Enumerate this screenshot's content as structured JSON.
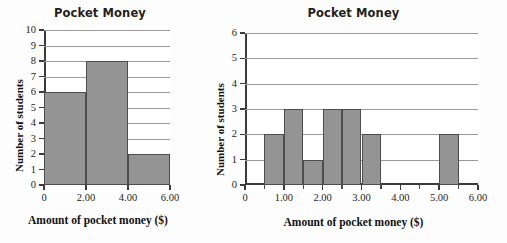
{
  "chart_data": [
    {
      "id": "left",
      "type": "bar",
      "title": "Pocket Money",
      "xlabel": "Amount of pocket money ($)",
      "ylabel": "Number of students",
      "grid": true,
      "xlim": [
        0,
        6
      ],
      "ylim": [
        0,
        10
      ],
      "yticks": [
        0,
        1,
        2,
        3,
        4,
        5,
        6,
        7,
        8,
        9,
        10
      ],
      "ytick_labels": [
        "0",
        "1",
        "2",
        "3",
        "4",
        "5",
        "6",
        "7",
        "8",
        "9",
        "10"
      ],
      "xticks": [
        0,
        2,
        4,
        6
      ],
      "xtick_labels": [
        "0",
        "2.00",
        "4.00",
        "6.00"
      ],
      "bin_width": 2,
      "bins": [
        {
          "start": 0,
          "end": 2,
          "value": 6
        },
        {
          "start": 2,
          "end": 4,
          "value": 8
        },
        {
          "start": 4,
          "end": 6,
          "value": 2
        }
      ]
    },
    {
      "id": "right",
      "type": "bar",
      "title": "Pocket Money",
      "xlabel": "Amount of pocket money ($)",
      "ylabel": "Number of students",
      "grid": true,
      "xlim": [
        0,
        6
      ],
      "ylim": [
        0,
        6
      ],
      "yticks": [
        0,
        1,
        2,
        3,
        4,
        5,
        6
      ],
      "ytick_labels": [
        "0",
        "1",
        "2",
        "3",
        "4",
        "5",
        "6"
      ],
      "xticks": [
        0,
        1,
        2,
        3,
        4,
        5,
        6
      ],
      "xtick_labels": [
        "0",
        "1.00",
        "2.00",
        "3.00",
        "4.00",
        "5.00",
        "6.00"
      ],
      "xticks_minor": [
        0.5,
        1.5,
        2.5,
        3.5,
        4.5,
        5.5
      ],
      "bin_width": 0.5,
      "bins": [
        {
          "start": 0.5,
          "end": 1.0,
          "value": 2
        },
        {
          "start": 1.0,
          "end": 1.5,
          "value": 3
        },
        {
          "start": 1.5,
          "end": 2.0,
          "value": 1
        },
        {
          "start": 2.0,
          "end": 2.5,
          "value": 3
        },
        {
          "start": 2.5,
          "end": 3.0,
          "value": 3
        },
        {
          "start": 3.0,
          "end": 3.5,
          "value": 2
        },
        {
          "start": 5.0,
          "end": 5.5,
          "value": 2
        }
      ]
    }
  ],
  "colors": {
    "bar_fill": "#949494",
    "bar_stroke": "#4d4d4d",
    "axis": "#3b3b3b",
    "grid": "#9a9a9a",
    "text": "#1d1d1d",
    "background": "#ffffff"
  }
}
